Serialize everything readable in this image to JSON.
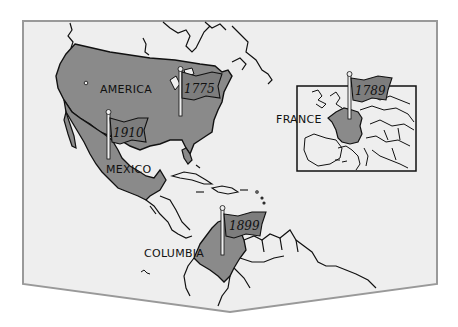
{
  "map": {
    "colors": {
      "background": "#ffffff",
      "panel_fill": "#eeeeee",
      "panel_border": "#999999",
      "land_highlight": "#8a8a8a",
      "outline": "#111111",
      "flag_fill": "#7d7d7d"
    },
    "labels": [
      {
        "id": "america",
        "text": "AMERICA"
      },
      {
        "id": "mexico",
        "text": "MEXICO"
      },
      {
        "id": "columbia",
        "text": "COLUMBIA"
      },
      {
        "id": "france",
        "text": "FRANCE"
      }
    ],
    "flags": [
      {
        "id": "flag-1775",
        "year": "1775",
        "region": "America (east coast)"
      },
      {
        "id": "flag-1910",
        "year": "1910",
        "region": "Mexico"
      },
      {
        "id": "flag-1899",
        "year": "1899",
        "region": "Columbia"
      },
      {
        "id": "flag-1789",
        "year": "1789",
        "region": "France"
      }
    ],
    "inset": {
      "name": "Europe inset"
    }
  }
}
